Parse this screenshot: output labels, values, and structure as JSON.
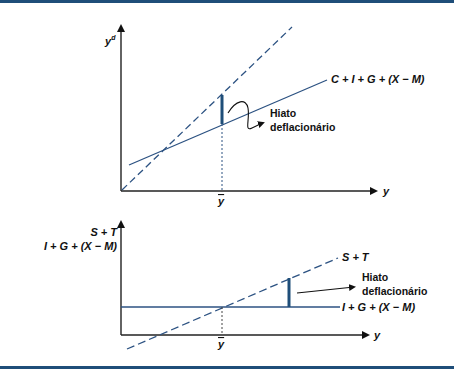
{
  "colors": {
    "frame": "#1f4e79",
    "curve": "#2c5282",
    "gap": "#1f4e79",
    "axis": "#222222"
  },
  "top_chart": {
    "y_axis_label": "y",
    "y_axis_superscript": "d",
    "x_axis_label": "y",
    "equilibrium_label": "y",
    "aggregate_demand_label": "C + I + G + (X − M)",
    "gap_label_line1": "Hiato",
    "gap_label_line2": "deflacionário",
    "lines": [
      {
        "name": "45-degree line",
        "style": "dashed"
      },
      {
        "name": "C + I + G + (X − M)",
        "style": "solid"
      }
    ]
  },
  "bottom_chart": {
    "y_axis_label_line1": "S + T",
    "y_axis_label_line2": "I + G + (X − M)",
    "x_axis_label": "y",
    "equilibrium_label": "y",
    "savings_line_label": "S + T",
    "injections_line_label": "I + G + (X − M)",
    "gap_label_line1": "Hiato",
    "gap_label_line2": "deflacionário",
    "lines": [
      {
        "name": "S + T",
        "style": "dashed"
      },
      {
        "name": "I + G + (X − M)",
        "style": "solid"
      }
    ]
  }
}
